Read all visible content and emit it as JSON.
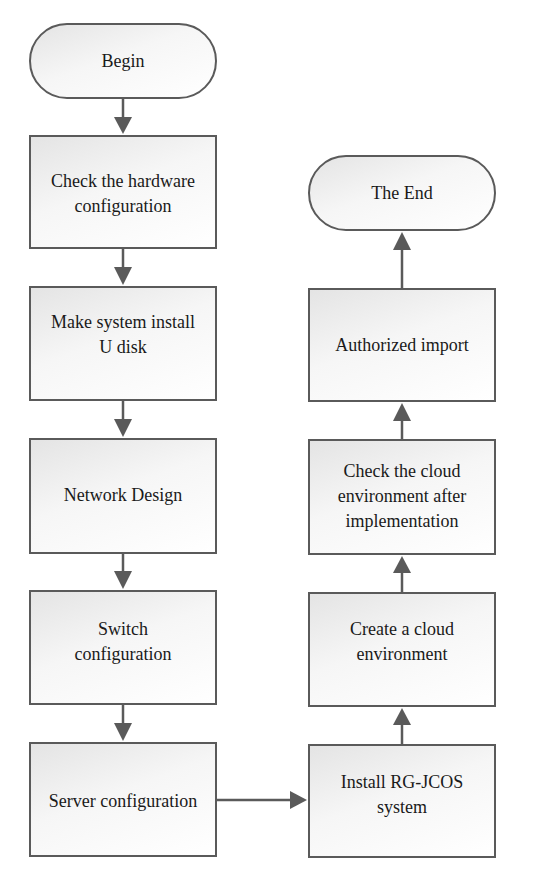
{
  "diagram": {
    "type": "flowchart",
    "colors": {
      "stroke": "#5a5a5a",
      "fill_start": "#e4e4e4",
      "fill_end": "#ffffff",
      "text": "#1a1a1a"
    },
    "nodes": [
      {
        "id": "begin",
        "shape": "terminator",
        "label": "Begin",
        "x": 29,
        "y": 23,
        "w": 188,
        "h": 76
      },
      {
        "id": "check_hw",
        "shape": "process",
        "label": "Check the hardware configuration",
        "lines": [
          "Check the hardware",
          "configuration"
        ],
        "x": 29,
        "y": 135,
        "w": 188,
        "h": 114,
        "pad": 33
      },
      {
        "id": "make_usb",
        "shape": "process",
        "label": "Make system install U disk",
        "lines": [
          "Make system install",
          "U disk"
        ],
        "x": 29,
        "y": 286,
        "w": 188,
        "h": 115,
        "pad": 22
      },
      {
        "id": "network",
        "shape": "process",
        "label": "Network Design",
        "lines": [
          "Network Design"
        ],
        "x": 29,
        "y": 438,
        "w": 188,
        "h": 116,
        "pad": 42
      },
      {
        "id": "switch",
        "shape": "process",
        "label": "Switch configuration",
        "lines": [
          "Switch",
          "configuration"
        ],
        "x": 29,
        "y": 590,
        "w": 188,
        "h": 115,
        "pad": 25
      },
      {
        "id": "server",
        "shape": "process",
        "label": "Server configuration",
        "lines": [
          "Server configuration"
        ],
        "x": 29,
        "y": 742,
        "w": 188,
        "h": 115,
        "pad": 38
      },
      {
        "id": "install",
        "shape": "process",
        "label": "Install RG-JCOS system",
        "lines": [
          "Install RG-JCOS",
          "system"
        ],
        "x": 308,
        "y": 744,
        "w": 188,
        "h": 114,
        "pad": 23
      },
      {
        "id": "create_cloud",
        "shape": "process",
        "label": "Create a cloud environment",
        "lines": [
          "Create a cloud",
          "environment"
        ],
        "x": 308,
        "y": 592,
        "w": 188,
        "h": 115,
        "pad": 24
      },
      {
        "id": "check_cloud",
        "shape": "process",
        "label": "Check the cloud environment after implementation",
        "lines": [
          "Check the cloud",
          "environment after",
          "implementation"
        ],
        "x": 308,
        "y": 439,
        "w": 188,
        "h": 116,
        "pad": 16
      },
      {
        "id": "auth_import",
        "shape": "process",
        "label": "Authorized import",
        "lines": [
          "Authorized import"
        ],
        "x": 308,
        "y": 288,
        "w": 188,
        "h": 114,
        "pad": 42
      },
      {
        "id": "end",
        "shape": "terminator",
        "label": "The End",
        "x": 308,
        "y": 155,
        "w": 188,
        "h": 76
      }
    ],
    "edges": [
      {
        "from": "begin",
        "to": "check_hw"
      },
      {
        "from": "check_hw",
        "to": "make_usb"
      },
      {
        "from": "make_usb",
        "to": "network"
      },
      {
        "from": "network",
        "to": "switch"
      },
      {
        "from": "switch",
        "to": "server"
      },
      {
        "from": "server",
        "to": "install"
      },
      {
        "from": "install",
        "to": "create_cloud"
      },
      {
        "from": "create_cloud",
        "to": "check_cloud"
      },
      {
        "from": "check_cloud",
        "to": "auth_import"
      },
      {
        "from": "auth_import",
        "to": "end"
      }
    ]
  }
}
